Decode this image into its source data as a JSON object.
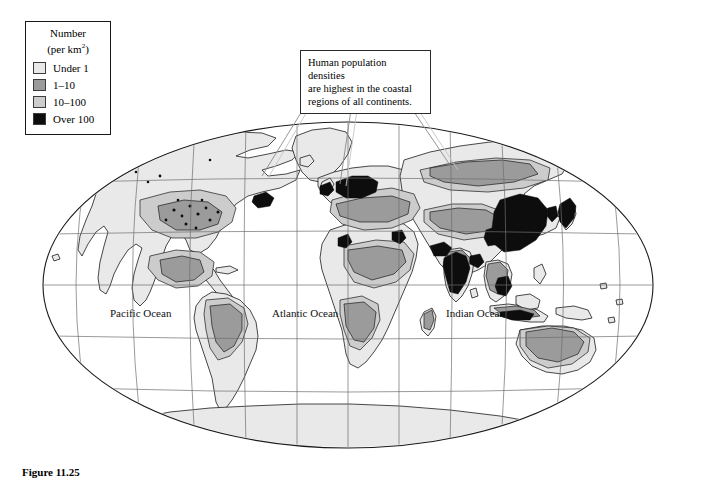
{
  "figure": {
    "caption": "Figure 11.25",
    "projection": "robinson-elliptical"
  },
  "legend": {
    "title_line1": "Number",
    "title_line2_prefix": "(per km",
    "title_line2_sup": "2",
    "title_line2_suffix": ")",
    "items": [
      {
        "label": "Under 1",
        "color": "#e9e9e9"
      },
      {
        "label": "1–10",
        "color": "#9b9b9b"
      },
      {
        "label": "10–100",
        "color": "#cccccc"
      },
      {
        "label": "Over 100",
        "color": "#0d0d0d"
      }
    ]
  },
  "callout": {
    "line1": "Human population densities",
    "line2": "are highest in the coastal",
    "line3": "regions of all continents.",
    "text": "Human population densities are highest in the coastal regions of all continents."
  },
  "ocean_labels": [
    {
      "name": "Pacific Ocean"
    },
    {
      "name": "Atlantic Ocean"
    },
    {
      "name": "Indian Ocean"
    }
  ],
  "colors": {
    "under_1": "#e9e9e9",
    "d1_10": "#9b9b9b",
    "d10_100": "#cccccc",
    "over_100": "#0d0d0d",
    "graticule": "#6e6e6e",
    "coastline": "#1a1a1a",
    "ocean": "#ffffff",
    "border": "#1a1a1a"
  },
  "graticule": {
    "parallels": [
      60,
      30,
      0,
      -30,
      -60
    ],
    "meridians": [
      -150,
      -120,
      -90,
      -60,
      -30,
      0,
      30,
      60,
      90,
      120,
      150
    ],
    "grid_visible": true
  }
}
